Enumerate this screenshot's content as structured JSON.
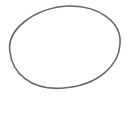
{
  "canvas": {
    "width": 132,
    "height": 114,
    "background": "#ffffff"
  },
  "shape": {
    "type": "ellipse",
    "cx": 64.5,
    "cy": 47.5,
    "rx": 56,
    "ry": 41,
    "stroke": "#676767",
    "stroke_width": 1.6,
    "fill": "none"
  }
}
